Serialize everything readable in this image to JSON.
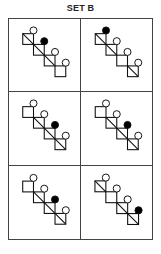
{
  "title": "SET B",
  "colors": {
    "stroke": "#111111",
    "filled_circle": "#000000",
    "open_circle": "#ffffff",
    "grid_line": "#444444"
  },
  "figure": {
    "squares_per_figure": 4
  },
  "panels": [
    {
      "id": 1,
      "row": 1,
      "col": 1,
      "diagonals": [
        true,
        true,
        true,
        false
      ],
      "filled_circle_index": 2
    },
    {
      "id": 2,
      "row": 1,
      "col": 2,
      "diagonals": [
        true,
        true,
        false,
        true
      ],
      "filled_circle_index": 1
    },
    {
      "id": 3,
      "row": 2,
      "col": 1,
      "diagonals": [
        false,
        true,
        true,
        true
      ],
      "filled_circle_index": 3
    },
    {
      "id": 4,
      "row": 2,
      "col": 2,
      "diagonals": [
        false,
        true,
        true,
        true
      ],
      "filled_circle_index": 3
    },
    {
      "id": 5,
      "row": 3,
      "col": 1,
      "diagonals": [
        false,
        true,
        true,
        true
      ],
      "filled_circle_index": 3
    },
    {
      "id": 6,
      "row": 3,
      "col": 2,
      "diagonals": [
        true,
        false,
        true,
        true
      ],
      "filled_circle_index": 4
    }
  ]
}
